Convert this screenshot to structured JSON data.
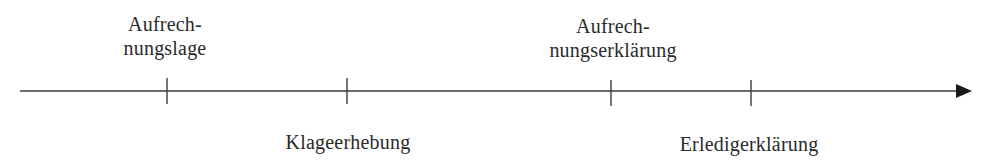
{
  "diagram": {
    "type": "timeline",
    "axis": {
      "x_start": 20,
      "x_end": 972,
      "y": 91,
      "color": "#3a3a3a",
      "arrow": "right"
    },
    "events": [
      {
        "id": "aufrechnungslage",
        "x": 167,
        "position": "above",
        "lines": [
          "Aufrech-",
          "nungslage"
        ]
      },
      {
        "id": "klageerhebung",
        "x": 347,
        "position": "below",
        "lines": [
          "Klageerhebung"
        ]
      },
      {
        "id": "aufrechnungserklaerung",
        "x": 611,
        "position": "above",
        "lines": [
          "Aufrech-",
          "nungserklärung"
        ]
      },
      {
        "id": "erledigerklaerung",
        "x": 751,
        "position": "below",
        "lines": [
          "Erledigerklärung"
        ]
      }
    ]
  }
}
